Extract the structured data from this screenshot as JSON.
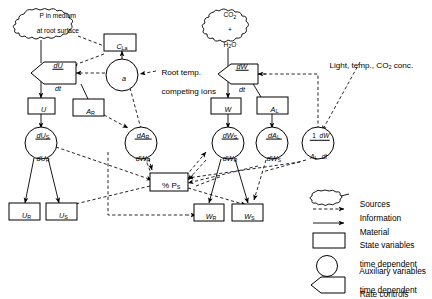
{
  "diagram": {
    "sources": [
      {
        "id": "src-p",
        "line1": "P in medium",
        "line2": "at root surface"
      },
      {
        "id": "src-co2",
        "line1": "CO",
        "sub1": "2",
        "line2": "+",
        "line3": "H",
        "sub3": "2",
        "line3b": "O"
      }
    ],
    "annotations": [
      {
        "id": "root-temp",
        "line1": "Root temp.",
        "line2": "competing ions"
      },
      {
        "id": "light-temp",
        "text": "Light, temp., CO₂ conc."
      }
    ],
    "state_variables": [
      {
        "id": "C_La",
        "main": "C",
        "sub": "La"
      },
      {
        "id": "U",
        "main": "U",
        "sub": ""
      },
      {
        "id": "A_R",
        "main": "A",
        "sub": "R"
      },
      {
        "id": "W",
        "main": "W",
        "sub": ""
      },
      {
        "id": "A_L",
        "main": "A",
        "sub": "L"
      },
      {
        "id": "U_R",
        "main": "U",
        "sub": "R"
      },
      {
        "id": "U_S",
        "main": "U",
        "sub": "S"
      },
      {
        "id": "W_R",
        "main": "W",
        "sub": "R"
      },
      {
        "id": "W_S",
        "main": "W",
        "sub": "S"
      },
      {
        "id": "pct_PS",
        "main": "% P",
        "sub": "S"
      }
    ],
    "auxiliary_variables": [
      {
        "id": "a",
        "label": "a"
      },
      {
        "id": "dUs_dUr",
        "num": "dU",
        "num_sub": "S",
        "den": "dU",
        "den_sub": "R"
      },
      {
        "id": "dAr_dWr",
        "num": "dA",
        "num_sub": "R",
        "den": "dW",
        "den_sub": "R"
      },
      {
        "id": "dWs_dWr",
        "num": "dW",
        "num_sub": "S",
        "den": "dW",
        "den_sub": "R"
      },
      {
        "id": "dAl_dWs",
        "num": "dA",
        "num_sub": "L",
        "den": "dW",
        "den_sub": "S"
      },
      {
        "id": "one_over_Al_dWdt",
        "pre_num": "1",
        "pre_den": "A",
        "pre_den_sub": "L",
        "num": "dW",
        "den": "dt"
      }
    ],
    "rate_controls": [
      {
        "id": "dU_dt",
        "num": "dU",
        "den": "dt"
      },
      {
        "id": "dW_dt",
        "num": "dW",
        "den": "dt"
      }
    ],
    "legend": {
      "items": [
        {
          "id": "legend-sources",
          "symbol": "cloud",
          "label": "Sources"
        },
        {
          "id": "legend-information",
          "symbol": "dashed-arrow",
          "label": "Information"
        },
        {
          "id": "legend-material",
          "symbol": "solid-arrow",
          "label": "Material"
        },
        {
          "id": "legend-state",
          "symbol": "rectangle",
          "line1": "State variables",
          "line2": "time dependent"
        },
        {
          "id": "legend-auxiliary",
          "symbol": "circle",
          "line1": "Auxiliary variables",
          "line2": "time dependent"
        },
        {
          "id": "legend-rate",
          "symbol": "rate-pentagon",
          "label": "Rate controls"
        }
      ]
    },
    "colors": {
      "ink": "#000000",
      "paper": "#ffffff"
    }
  }
}
